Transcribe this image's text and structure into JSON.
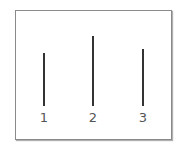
{
  "diagram": {
    "items": [
      {
        "label": "1",
        "x": 44,
        "top": 53,
        "bottom": 106
      },
      {
        "label": "2",
        "x": 93,
        "top": 36,
        "bottom": 106
      },
      {
        "label": "3",
        "x": 143,
        "top": 49,
        "bottom": 106
      }
    ]
  }
}
